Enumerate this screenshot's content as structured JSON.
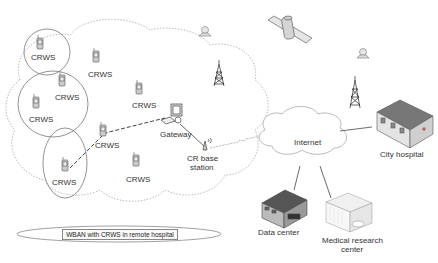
{
  "diagram": {
    "nodes": {
      "crws": [
        {
          "label": "CRWS",
          "x": 47,
          "y": 59
        },
        {
          "label": "CRWS",
          "x": 100,
          "y": 72
        },
        {
          "label": "CRWS",
          "x": 65,
          "y": 96
        },
        {
          "label": "CRWS",
          "x": 37,
          "y": 118
        },
        {
          "label": "CRWS",
          "x": 147,
          "y": 104
        },
        {
          "label": "CRWS",
          "x": 113,
          "y": 145
        },
        {
          "label": "CRWS",
          "x": 68,
          "y": 182
        },
        {
          "label": "CRWS",
          "x": 140,
          "y": 177
        }
      ],
      "gateway": {
        "label": "Gateway"
      },
      "cr_base_station": {
        "label_line1": "CR base",
        "label_line2": "station"
      },
      "internet": {
        "label": "Internet"
      },
      "city_hospital": {
        "label": "City hospital"
      },
      "data_center": {
        "label": "Data center"
      },
      "medical_research_center": {
        "label_line1": "Medical research",
        "label_line2": "center"
      }
    },
    "caption": "WBAN with CRWS in remote hospital",
    "colors": {
      "line": "#555555",
      "dotted_cloud": "#999999",
      "building_roof": "#666666",
      "building_wall": "#dddddd"
    }
  }
}
